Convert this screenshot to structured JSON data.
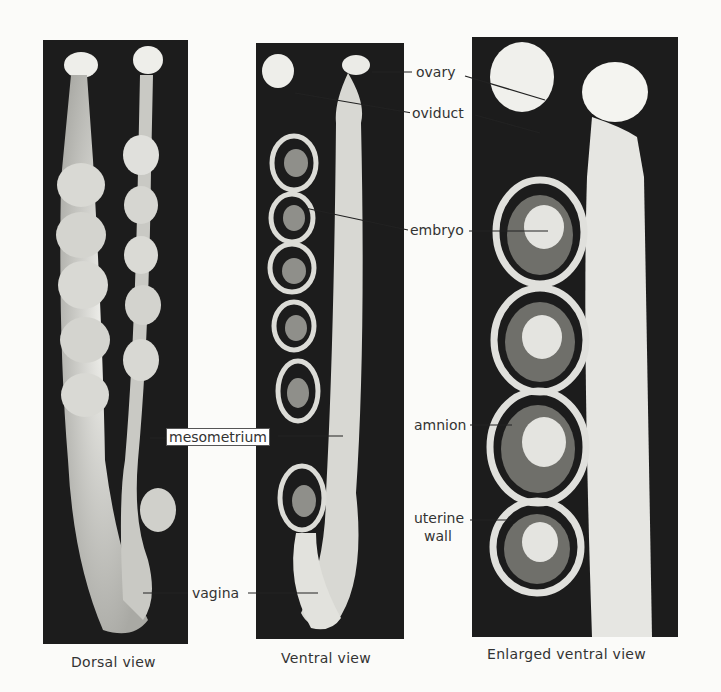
{
  "figure": {
    "panels": [
      {
        "id": "dorsal",
        "caption": "Dorsal view"
      },
      {
        "id": "ventral",
        "caption": "Ventral view"
      },
      {
        "id": "enlarged",
        "caption": "Enlarged ventral view"
      }
    ],
    "labels": {
      "ovary": "ovary",
      "oviduct": "oviduct",
      "embryo": "embryo",
      "mesometrium": "mesometrium",
      "amnion": "amnion",
      "uterine_wall_line1": "uterine",
      "uterine_wall_line2": "wall",
      "vagina": "vagina"
    },
    "colors": {
      "background": "#fbfbf9",
      "panel": "#1c1c1c",
      "tissue": "#e6e6e2",
      "text": "#333333"
    }
  }
}
